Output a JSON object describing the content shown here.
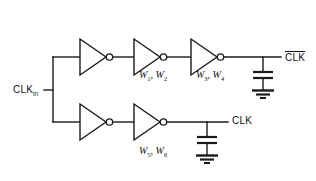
{
  "diagram": {
    "background_color": "#ffffff",
    "line_color": "#1a1a1a"
  },
  "ports": {
    "input": {
      "name": "CLK",
      "subscript": "in",
      "label": "CLK"
    },
    "output_top": {
      "label": "CLK",
      "overbar": true
    },
    "output_bottom": {
      "label": "CLK",
      "overbar": false
    }
  },
  "labels": {
    "top_chain_first": {
      "w": "W",
      "sub1": "1",
      "sub2": "2",
      "text": "W1, W2"
    },
    "top_chain_second": {
      "w": "W",
      "sub1": "3",
      "sub2": "4",
      "text": "W3, W4"
    },
    "bottom_chain": {
      "w": "W",
      "sub1": "5",
      "sub2": "6",
      "text": "W5, W6"
    },
    "comma": ", "
  },
  "branches": [
    {
      "name": "inverted-clock-branch",
      "inverter_count": 3,
      "output": "CLK-bar",
      "width_labels": [
        "W1, W2",
        "W3, W4"
      ]
    },
    {
      "name": "true-clock-branch",
      "inverter_count": 2,
      "output": "CLK",
      "width_labels": [
        "W5, W6"
      ]
    }
  ],
  "components": {
    "inverter": {
      "icon": "inverter-triangle-icon",
      "count": 5
    },
    "capacitor": {
      "icon": "capacitor-icon",
      "count": 2
    },
    "ground": {
      "icon": "ground-icon",
      "count": 2
    }
  }
}
